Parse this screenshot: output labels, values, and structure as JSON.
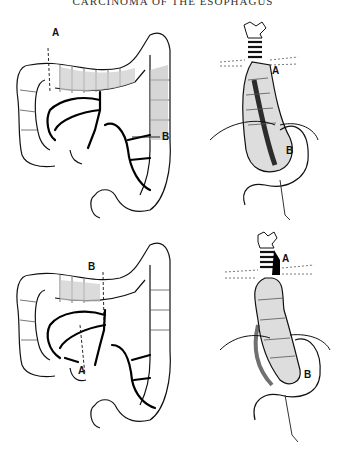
{
  "header": {
    "title": "CARCINOMA OF THE ESOPHAGUS"
  },
  "figures": [
    {
      "name": "colon-top",
      "description": "Colon with marked transection lines A (right/transverse colon) and B (descending colon)",
      "labels": {
        "a": "A",
        "b": "B"
      }
    },
    {
      "name": "esophagus-top",
      "description": "Colon interposition placed in posterior mediastinum, anastomosis at A (cervical) and B (stomach)",
      "labels": {
        "a": "A",
        "b": "B"
      }
    },
    {
      "name": "colon-bottom",
      "description": "Colon with transection lines B (transverse colon) and A (ileocecal region)",
      "labels": {
        "a": "A",
        "b": "B"
      }
    },
    {
      "name": "esophagus-bottom",
      "description": "Alternate colon interposition with anastomosis at A (cervical) and B (stomach)",
      "labels": {
        "a": "A",
        "b": "B"
      }
    }
  ]
}
